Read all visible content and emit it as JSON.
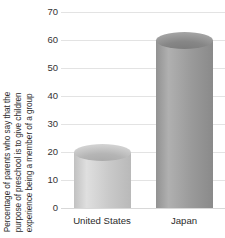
{
  "chart_data": {
    "type": "bar",
    "title": "",
    "subtitle": "",
    "xlabel": "",
    "ylabel_lines": [
      "Percentage of parents who say that the",
      "purpose of preschool is to give children",
      "experience being a member of a group"
    ],
    "ylabel": "Percentage of parents who say that the purpose of preschool is to give children experience being a member of a group",
    "categories": [
      "United States",
      "Japan"
    ],
    "values": [
      20,
      60
    ],
    "ylim": [
      0,
      70
    ],
    "ytick_labels": [
      "0",
      "10",
      "20",
      "30",
      "40",
      "50",
      "60",
      "70"
    ],
    "ytick_values": [
      0,
      10,
      20,
      30,
      40,
      50,
      60,
      70
    ],
    "ytick_step": 10,
    "grid": true,
    "legend": false,
    "legend_position": "none",
    "bar_style": "cylinder",
    "bar_colors": [
      "#c9c9c9",
      "#9a9a9a"
    ],
    "gridline_color": "#e3e3e3",
    "text_color": "#2b2b2b",
    "background": "#ffffff"
  }
}
